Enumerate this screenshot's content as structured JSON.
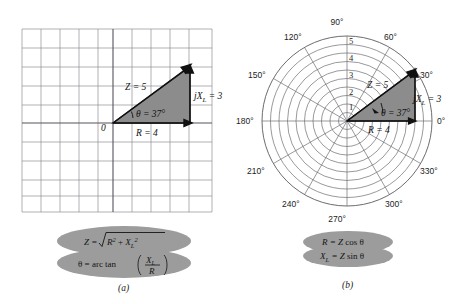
{
  "figure": {
    "panel_a": {
      "caption": "(a)",
      "type": "rectangular-grid-phasor",
      "origin_label": "0",
      "vectors": [
        {
          "name": "R",
          "label": "R = 4",
          "value": 4,
          "direction": "horizontal"
        },
        {
          "name": "XL",
          "label": "jX",
          "label_sub": "L",
          "label_tail": " = 3",
          "value": 3,
          "direction": "vertical"
        },
        {
          "name": "Z",
          "label": "Z = 5",
          "value": 5,
          "direction": "resultant"
        }
      ],
      "angle_label": "θ = 37°",
      "angle_value": 37,
      "grid": {
        "cols": 10,
        "rows": 10,
        "cell_px": 19
      }
    },
    "panel_b": {
      "caption": "(b)",
      "type": "polar-plot-phasor",
      "angle_labels": [
        "0°",
        "30°",
        "60°",
        "90°",
        "120°",
        "150°",
        "180°",
        "210°",
        "240°",
        "270°",
        "300°",
        "330°"
      ],
      "radial_ticks": [
        "1",
        "2",
        "3",
        "4",
        "5"
      ],
      "radial_max": 5,
      "rings": 10,
      "spokes": 12,
      "vectors": [
        {
          "name": "R",
          "label": "R = 4",
          "value": 4
        },
        {
          "name": "XL",
          "label": "jX",
          "label_sub": "L",
          "label_tail": " = 3",
          "value": 3
        },
        {
          "name": "Z",
          "label": "Z = 5",
          "value": 5
        }
      ],
      "angle_label": "θ = 37°",
      "angle_value": 37
    },
    "formulas_a": {
      "line1_lead": "Z = ",
      "line1_radicand_main": "R",
      "line1_radicand_sup1": "2",
      "line1_plus": " + ",
      "line1_x": "X",
      "line1_x_sub": "L",
      "line1_x_sup": "2",
      "line2_lead": "θ = arc tan",
      "line2_frac_num_main": "X",
      "line2_frac_num_sub": "L",
      "line2_frac_den": "R"
    },
    "formulas_b": {
      "line1_main": "R = Z",
      "line1_fn": " cos θ",
      "line2_main": "X",
      "line2_sub": "L",
      "line2_rest": " = Z",
      "line2_fn": " sin θ"
    },
    "colors": {
      "triangle_fill": "#8c8c8c",
      "triangle_stroke": "#1a1a1a",
      "grid_line": "#8f8f96",
      "axis_line": "#55555c",
      "polar_line": "#6d6d74",
      "ellipse_fill": "#9c9c9c",
      "background": "#ffffff"
    }
  }
}
